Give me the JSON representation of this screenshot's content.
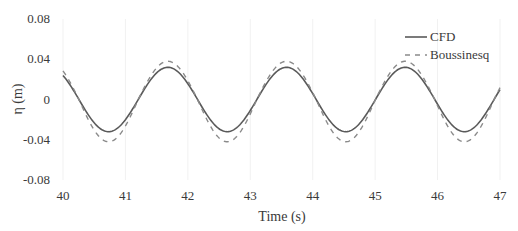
{
  "chart_data": {
    "type": "line",
    "title": "",
    "xlabel": "Time (s)",
    "ylabel": "η (m)",
    "xlim": [
      40,
      47
    ],
    "ylim": [
      -0.08,
      0.08
    ],
    "x_ticks": [
      40,
      41,
      42,
      43,
      44,
      45,
      46,
      47
    ],
    "y_ticks": [
      0.08,
      0.04,
      0,
      -0.04,
      -0.08
    ],
    "y_tick_labels": [
      "0.08",
      "0.04",
      "0",
      "-0.04",
      "-0.08"
    ],
    "grid": {
      "vertical": true,
      "horizontal": false
    },
    "legend": {
      "position": "upper right",
      "entries": [
        "CFD",
        "Boussinesq"
      ]
    },
    "x": [
      40.0,
      40.25,
      40.5,
      40.73,
      41.0,
      41.25,
      41.5,
      41.68,
      42.0,
      42.25,
      42.5,
      42.63,
      43.0,
      43.25,
      43.58,
      43.75,
      44.0,
      44.25,
      44.53,
      44.75,
      45.0,
      45.25,
      45.48,
      45.75,
      46.0,
      46.25,
      46.43,
      46.75,
      47.0
    ],
    "series": [
      {
        "name": "CFD",
        "style": "solid",
        "color": "#5a5a5a",
        "amplitude": 0.032,
        "period": 1.9,
        "crest_time": 41.68,
        "values": [
          0.021,
          -0.006,
          -0.025,
          -0.032,
          -0.024,
          -0.003,
          0.022,
          0.032,
          0.019,
          -0.005,
          -0.025,
          -0.031,
          -0.023,
          -0.001,
          0.032,
          0.027,
          0.009,
          -0.016,
          -0.032,
          -0.026,
          -0.003,
          0.021,
          0.032,
          0.021,
          -0.003,
          -0.025,
          -0.032,
          -0.022,
          0.003
        ]
      },
      {
        "name": "Boussinesq",
        "style": "dashed",
        "color": "#8a8a8a",
        "amplitude": 0.038,
        "trough_amplitude": 0.042,
        "period": 1.9,
        "crest_time": 41.68,
        "values": [
          0.023,
          -0.008,
          -0.032,
          -0.042,
          -0.03,
          -0.004,
          0.026,
          0.038,
          0.022,
          -0.007,
          -0.032,
          -0.041,
          -0.029,
          -0.001,
          0.038,
          0.032,
          0.01,
          -0.02,
          -0.042,
          -0.033,
          -0.004,
          0.025,
          0.038,
          0.025,
          -0.004,
          -0.032,
          -0.042,
          -0.028,
          0.004
        ]
      }
    ]
  },
  "axes": {
    "xlabel": "Time (s)",
    "ylabel": "η (m)"
  },
  "legend": {
    "cfd": "CFD",
    "boussinesq": "Boussinesq"
  }
}
